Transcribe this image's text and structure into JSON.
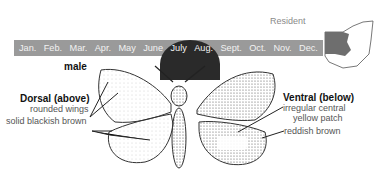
{
  "status": {
    "label": "Resident"
  },
  "calendar": {
    "months": [
      "Jan.",
      "Feb.",
      "Mar.",
      "Apr.",
      "May",
      "June",
      "July",
      "Aug.",
      "Sept.",
      "Oct.",
      "Nov.",
      "Dec."
    ],
    "flight_period": [
      "June",
      "July"
    ],
    "bar_color": "#9a9a9a",
    "flight_color": "#2a2a2a"
  },
  "map": {
    "region": "Ohio",
    "shaded_area": "northwest",
    "shade_color": "#6e6e6e"
  },
  "labels": {
    "sex": "male",
    "dorsal_heading": "Dorsal (above)",
    "dorsal_1": "rounded wings",
    "dorsal_2": "solid blackish brown",
    "ventral_heading": "Ventral (below)",
    "ventral_1a": "irregular central",
    "ventral_1b": "yellow patch",
    "ventral_2": "reddish brown"
  }
}
